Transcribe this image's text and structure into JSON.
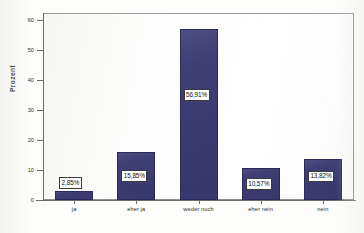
{
  "chart_data": {
    "type": "bar",
    "title": "",
    "xlabel": "",
    "ylabel": "Prozent",
    "categories": [
      "ja",
      "eher ja",
      "weder noch",
      "eher nein",
      "nein"
    ],
    "values": [
      2.85,
      15.85,
      56.91,
      10.57,
      13.82
    ],
    "data_labels": [
      "2,85%",
      "15,85%",
      "56,91%",
      "10,57%",
      "13,82%"
    ],
    "ylim": [
      0,
      62
    ],
    "yticks": [
      0,
      10,
      20,
      30,
      40,
      50,
      60
    ],
    "ytick_labels": [
      "0",
      "10",
      "20",
      "30",
      "40",
      "50",
      "60"
    ],
    "grid": false,
    "legend": "none",
    "bar_color": "#3b3a72",
    "bar_border_color": "#2c2b57",
    "label_box_bg": "#ffffff",
    "label_box_border": "#3a3a3a",
    "plot_background": "#fefefe",
    "plot_border_color": "#8d8d8d",
    "axis_color": "#6d6d6d"
  }
}
